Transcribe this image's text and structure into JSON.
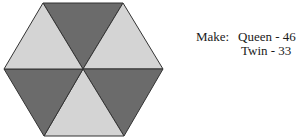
{
  "figure": {
    "shape": "regular hexagon divided into 6 triangles",
    "triangles": [
      {
        "position": "top",
        "shade": "dark",
        "color": "#6b6b6b"
      },
      {
        "position": "upper-right",
        "shade": "light",
        "color": "#d4d4d4"
      },
      {
        "position": "lower-right",
        "shade": "dark",
        "color": "#6b6b6b"
      },
      {
        "position": "bottom",
        "shade": "light",
        "color": "#d4d4d4"
      },
      {
        "position": "lower-left",
        "shade": "dark",
        "color": "#6b6b6b"
      },
      {
        "position": "upper-left",
        "shade": "light",
        "color": "#d4d4d4"
      }
    ],
    "stroke_color": "#333333"
  },
  "caption": {
    "make_label": "Make:",
    "items": [
      {
        "text": "Queen - 46"
      },
      {
        "text": "Twin - 33"
      }
    ]
  }
}
